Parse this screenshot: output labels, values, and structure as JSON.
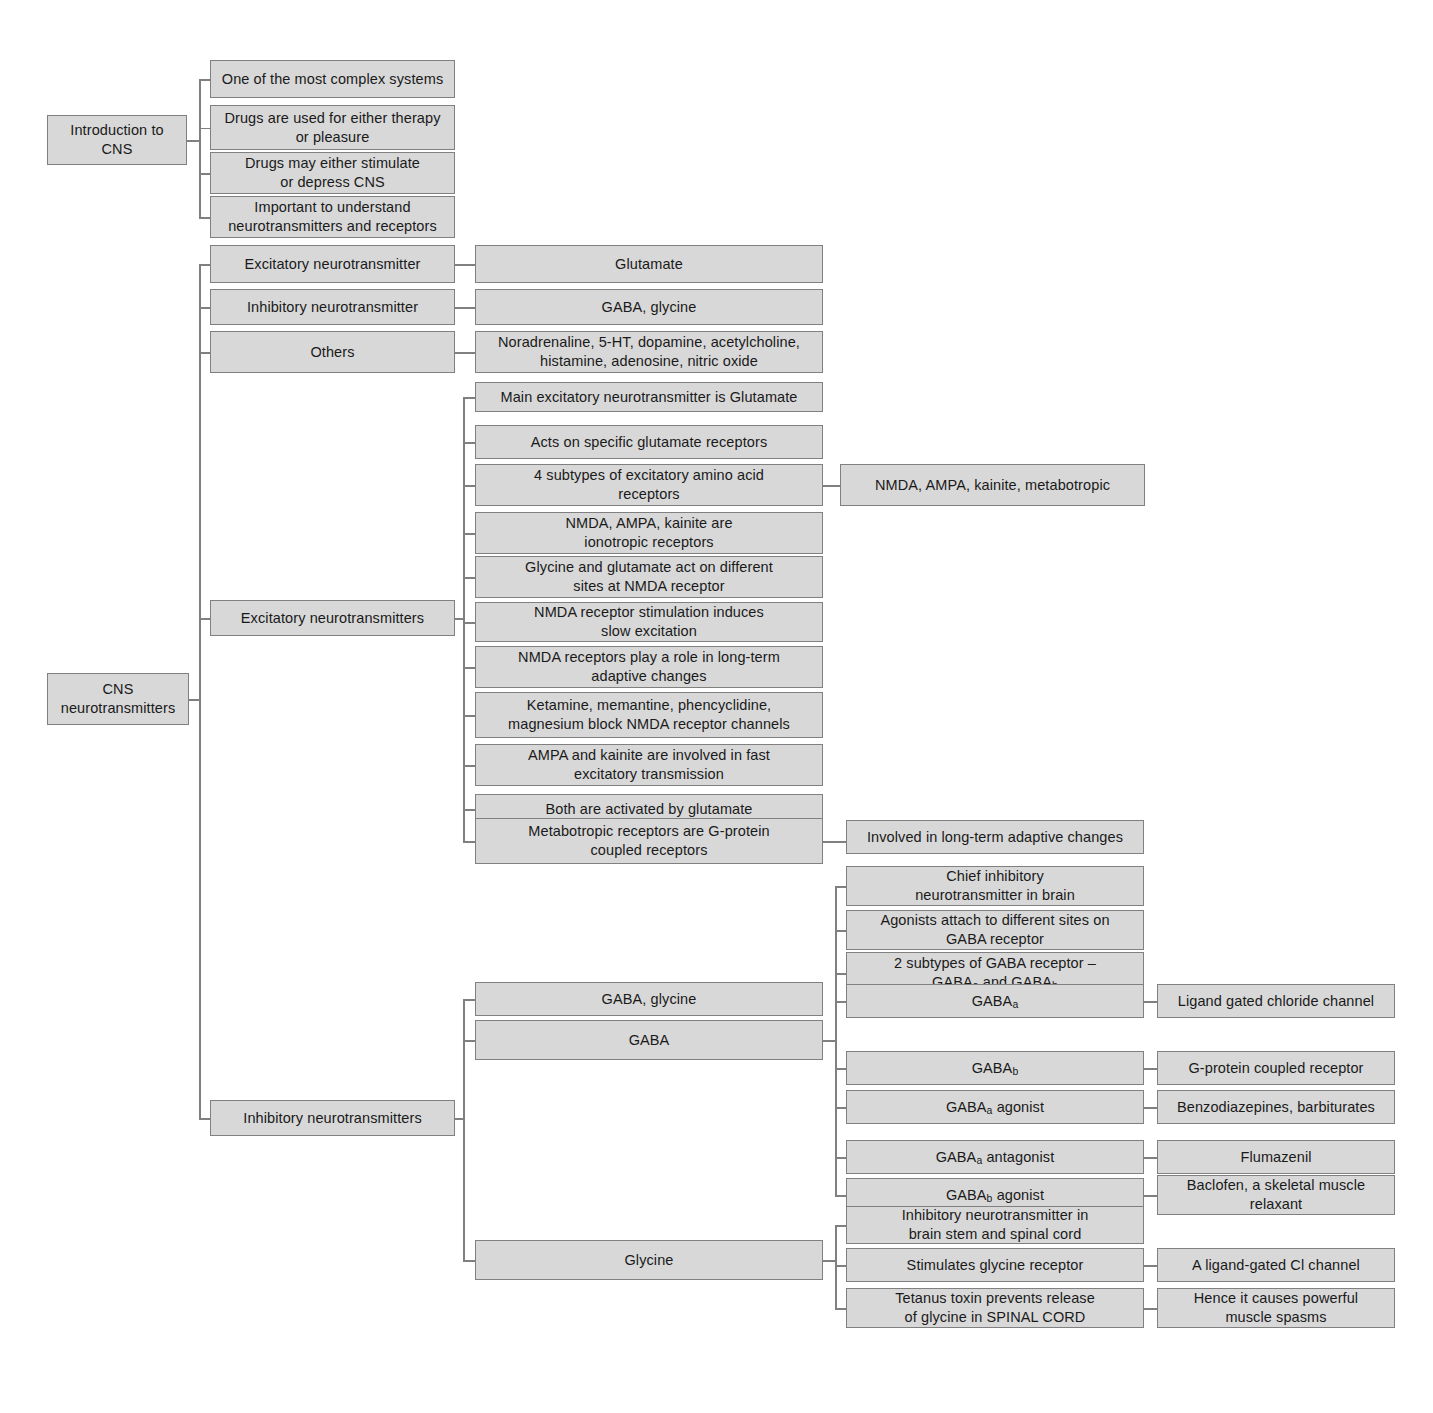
{
  "diagram": {
    "colors": {
      "node_fill": "#d8d8d8",
      "node_border": "#808080",
      "connector": "#808080",
      "text": "#1a1a1a",
      "background": "#ffffff"
    }
  },
  "roots": {
    "intro": "Introduction to\nCNS",
    "cns": "CNS\nneurotransmitters"
  },
  "intro_children": [
    "One of the most complex systems",
    "Drugs are used for either therapy\nor pleasure",
    "Drugs may either stimulate\nor depress CNS",
    "Important to understand\nneurotransmitters and receptors"
  ],
  "overview": [
    {
      "label": "Excitatory neurotransmitter",
      "detail": "Glutamate"
    },
    {
      "label": "Inhibitory neurotransmitter",
      "detail": "GABA, glycine"
    },
    {
      "label": "Others",
      "detail": "Noradrenaline, 5-HT, dopamine, acetylcholine,\nhistamine, adenosine, nitric oxide"
    }
  ],
  "excitatory": {
    "label": "Excitatory neurotransmitters",
    "items": [
      {
        "text": "Main excitatory neurotransmitter is Glutamate",
        "detail": null
      },
      {
        "text": "Acts on specific glutamate receptors",
        "detail": null
      },
      {
        "text": "4 subtypes of excitatory amino acid\nreceptors",
        "detail": "NMDA, AMPA, kainite, metabotropic"
      },
      {
        "text": "NMDA, AMPA, kainite are\nionotropic receptors",
        "detail": null
      },
      {
        "text": "Glycine and glutamate act on different\nsites at NMDA receptor",
        "detail": null
      },
      {
        "text": "NMDA receptor stimulation induces\nslow excitation",
        "detail": null
      },
      {
        "text": "NMDA receptors play a role in long-term\nadaptive changes",
        "detail": null
      },
      {
        "text": "Ketamine, memantine, phencyclidine,\nmagnesium block NMDA receptor channels",
        "detail": null
      },
      {
        "text": "AMPA and kainite are involved in fast\nexcitatory transmission",
        "detail": null
      },
      {
        "text": "Both are activated by glutamate",
        "detail": null
      },
      {
        "text": "Metabotropic receptors are G-protein\ncoupled receptors",
        "detail": "Involved in long-term adaptive changes"
      }
    ]
  },
  "inhibitory": {
    "label": "Inhibitory neurotransmitters",
    "summary": "GABA, glycine",
    "gaba": {
      "label": "GABA",
      "items": [
        {
          "text": "Chief inhibitory\nneurotransmitter in brain",
          "html": null,
          "detail": null
        },
        {
          "text": "Agonists attach to different sites on\nGABA receptor",
          "html": null,
          "detail": null
        },
        {
          "text": "2 subtypes of GABA receptor –\nGABAa and GABAb",
          "html": "2 subtypes of GABA receptor –<br>GABA<sub>a</sub> and GABA<sub>b</sub>",
          "detail": null
        },
        {
          "text": "GABAa",
          "html": "GABA<sub>a</sub>",
          "detail": "Ligand gated chloride channel"
        },
        {
          "text": "GABAb",
          "html": "GABA<sub>b</sub>",
          "detail": "G-protein coupled receptor"
        },
        {
          "text": "GABAa agonist",
          "html": "GABA<sub>a</sub> agonist",
          "detail": "Benzodiazepines, barbiturates"
        },
        {
          "text": "GABAa antagonist",
          "html": "GABA<sub>a</sub> antagonist",
          "detail": "Flumazenil"
        },
        {
          "text": "GABAb agonist",
          "html": "GABA<sub>b</sub> agonist",
          "detail": "Baclofen, a skeletal muscle\nrelaxant"
        }
      ]
    },
    "glycine": {
      "label": "Glycine",
      "items": [
        {
          "text": "Inhibitory neurotransmitter in\nbrain stem and spinal cord",
          "detail": null
        },
        {
          "text": "Stimulates glycine receptor",
          "detail": "A ligand-gated Cl channel"
        },
        {
          "text": "Tetanus toxin prevents release\nof glycine in SPINAL CORD",
          "detail": "Hence it causes powerful\nmuscle spasms"
        }
      ]
    }
  }
}
